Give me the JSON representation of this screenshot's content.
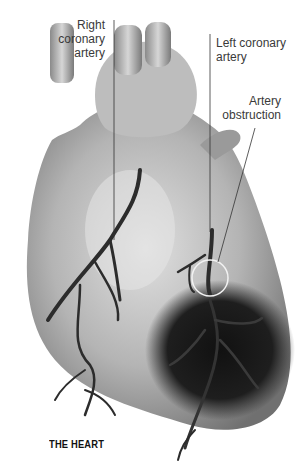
{
  "diagram": {
    "title": "THE HEART",
    "labels": {
      "right_coronary": [
        "Right",
        "coronary",
        "artery"
      ],
      "left_coronary": [
        "Left coronary",
        "artery"
      ],
      "obstruction": [
        "Artery",
        "obstruction"
      ]
    },
    "colors": {
      "background": "#ffffff",
      "heart_light": "#d4d4d4",
      "heart_mid": "#a8a8a8",
      "heart_dark": "#6e6e6e",
      "infarct": "#1e1e1e",
      "artery": "#2c2c2c",
      "leader_line": "#333333",
      "obstruction_circle": "#f2f2f2"
    }
  }
}
